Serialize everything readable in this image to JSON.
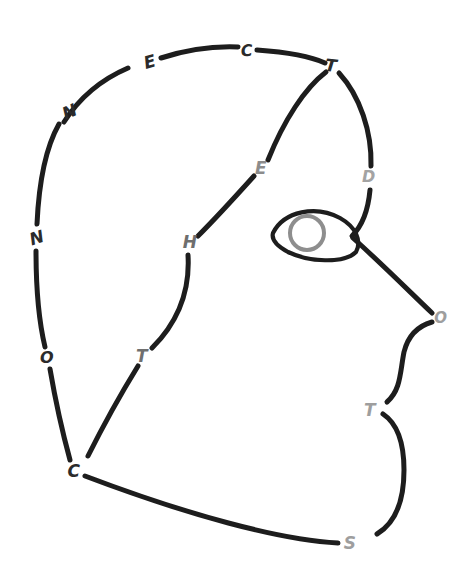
{
  "canvas": {
    "width": 474,
    "height": 572,
    "background": "#ffffff",
    "description": "hand-drawn face profile outline in broken strokes with letters in the gaps"
  },
  "palette": {
    "stroke_dark": "#1d1d1d",
    "letter_dark": "#2b2b2b",
    "letter_gray": "#9e9e9e",
    "iris_gray": "#8e8e8e",
    "background": "#ffffff"
  },
  "letters": [
    {
      "id": "letter-e-top-left",
      "char": "E",
      "x": 150,
      "y": 62,
      "color": "#2b2b2b",
      "size": 17,
      "rotate": -16
    },
    {
      "id": "letter-c-top",
      "char": "C",
      "x": 247,
      "y": 51,
      "color": "#2b2b2b",
      "size": 16,
      "rotate": -4
    },
    {
      "id": "letter-t-top-right",
      "char": "T",
      "x": 331,
      "y": 66,
      "color": "#2b2b2b",
      "size": 17,
      "rotate": 6
    },
    {
      "id": "letter-n-upper-left",
      "char": "N",
      "x": 70,
      "y": 112,
      "color": "#2b2b2b",
      "size": 17,
      "rotate": -24
    },
    {
      "id": "letter-n-mid-left",
      "char": "N",
      "x": 37,
      "y": 238,
      "color": "#2b2b2b",
      "size": 17,
      "rotate": -18
    },
    {
      "id": "letter-e-middle",
      "char": "E",
      "x": 261,
      "y": 168,
      "color": "#8c8c8c",
      "size": 17,
      "rotate": 0
    },
    {
      "id": "letter-d-right",
      "char": "D",
      "x": 369,
      "y": 177,
      "color": "#a3a3a3",
      "size": 16,
      "rotate": 0
    },
    {
      "id": "letter-h-middle",
      "char": "H",
      "x": 190,
      "y": 242,
      "color": "#6e6e6e",
      "size": 17,
      "rotate": 0
    },
    {
      "id": "letter-o-left",
      "char": "O",
      "x": 47,
      "y": 358,
      "color": "#2b2b2b",
      "size": 16,
      "rotate": 0
    },
    {
      "id": "letter-t-lower-left",
      "char": "T",
      "x": 142,
      "y": 356,
      "color": "#6f6f6f",
      "size": 17,
      "rotate": 0
    },
    {
      "id": "letter-o-nose",
      "char": "O",
      "x": 441,
      "y": 318,
      "color": "#9e9e9e",
      "size": 15,
      "rotate": 0
    },
    {
      "id": "letter-t-mouth",
      "char": "T",
      "x": 370,
      "y": 410,
      "color": "#9e9e9e",
      "size": 17,
      "rotate": 0
    },
    {
      "id": "letter-c-chin",
      "char": "C",
      "x": 74,
      "y": 471,
      "color": "#2b2b2b",
      "size": 17,
      "rotate": 0
    },
    {
      "id": "letter-s-jaw",
      "char": "S",
      "x": 350,
      "y": 543,
      "color": "#9e9e9e",
      "size": 17,
      "rotate": 0
    }
  ],
  "strokes": [
    {
      "id": "skull-arc-upper-left",
      "d": "M 64 122 C 78 100 100 80 128 68",
      "width": 5.0
    },
    {
      "id": "skull-arc-top-left",
      "d": "M 161 58 C 186 50 214 46 238 47",
      "width": 5.0
    },
    {
      "id": "skull-arc-top-right",
      "d": "M 257 50 C 286 52 312 57 325 63",
      "width": 5.0
    },
    {
      "id": "skull-arc-left-upper",
      "d": "M 59 124 C 46 147 39 180 37 224",
      "width": 5.0
    },
    {
      "id": "skull-arc-left-lower",
      "d": "M 36 251 C 36 292 40 326 45 347",
      "width": 5.0
    },
    {
      "id": "skull-arc-left-bottom",
      "d": "M 50 369 C 56 404 64 438 70 460",
      "width": 5.0
    },
    {
      "id": "back-of-head-to-d",
      "d": "M 339 73 C 360 96 372 132 371 166",
      "width": 5.0
    },
    {
      "id": "d-to-eye-crossing",
      "d": "M 370 190 C 368 212 362 226 352 236",
      "width": 5.0
    },
    {
      "id": "forehead-t-to-e",
      "d": "M 326 72 C 305 88 284 120 268 160",
      "width": 5.0
    },
    {
      "id": "brow-e-to-h",
      "d": "M 254 176 C 236 196 214 220 198 236",
      "width": 5.0
    },
    {
      "id": "cheek-h-to-t",
      "d": "M 188 255 C 190 288 180 320 152 348",
      "width": 5.0
    },
    {
      "id": "cheek-t-to-c",
      "d": "M 138 366 C 122 392 106 420 88 456",
      "width": 5.0
    },
    {
      "id": "nose-bridge",
      "d": "M 353 238 C 380 262 412 294 432 313",
      "width": 5.0
    },
    {
      "id": "nose-to-lip",
      "d": "M 432 322 C 418 326 408 336 404 352 C 400 372 401 390 387 402",
      "width": 5.0
    },
    {
      "id": "lip-to-jaw",
      "d": "M 383 414 C 398 424 404 444 404 470 C 404 498 397 522 377 534",
      "width": 5.0
    },
    {
      "id": "jawline-s-to-c",
      "d": "M 338 543 C 280 540 188 515 85 476",
      "width": 5.0
    },
    {
      "id": "eye-almond",
      "d": "M 273 233 C 284 211 316 205 340 218 C 356 227 362 241 356 252 C 344 264 308 262 288 252 C 277 246 271 240 273 233 Z",
      "width": 4.2
    }
  ],
  "iris": {
    "id": "eye-iris",
    "cx": 307,
    "cy": 233,
    "r": 17,
    "stroke": "#8e8e8e",
    "width": 4.0
  }
}
